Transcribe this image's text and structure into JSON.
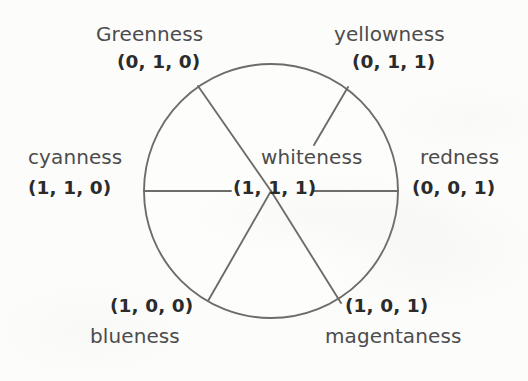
{
  "diagram": {
    "type": "color-wheel",
    "background_color": "#fcfcfb",
    "stroke_color": "#6e6c68",
    "label_color": "#4c4c4c",
    "triple_color": "#2b2b2b",
    "circle": {
      "cx": 271,
      "cy": 191,
      "r": 127
    },
    "center": {
      "label": "whiteness",
      "triple": "(1, 1, 1)"
    },
    "sectors": [
      {
        "key": "greenness",
        "label": "Greenness",
        "triple": "(0, 1, 0)",
        "rgb": [
          0,
          1,
          0
        ],
        "spoke_angle_deg": 125
      },
      {
        "key": "yellowness",
        "label": "yellowness",
        "triple": "(0, 1, 1)",
        "rgb": [
          0,
          1,
          1
        ],
        "spoke_angle_deg": 57
      },
      {
        "key": "cyanness",
        "label": "cyanness",
        "triple": "(1, 1, 0)",
        "rgb": [
          1,
          1,
          0
        ],
        "spoke_angle_deg": 180
      },
      {
        "key": "redness",
        "label": "redness",
        "triple": "(0, 0, 1)",
        "rgb": [
          0,
          0,
          1
        ],
        "spoke_angle_deg": 0
      },
      {
        "key": "blueness",
        "label": "blueness",
        "triple": "(1, 0, 0)",
        "rgb": [
          1,
          0,
          0
        ],
        "spoke_angle_deg": 240
      },
      {
        "key": "magentaness",
        "label": "magentaness",
        "triple": "(1, 0, 1)",
        "rgb": [
          1,
          0,
          1
        ],
        "spoke_angle_deg": 299
      }
    ]
  }
}
